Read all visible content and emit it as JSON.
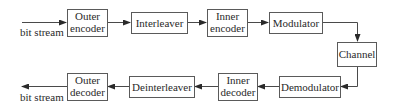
{
  "diagram": {
    "type": "block-diagram",
    "title": "",
    "input_label": "bit stream",
    "output_label": "bit stream",
    "transmit_chain": [
      {
        "id": "outer_encoder",
        "line1": "Outer",
        "line2": "encoder"
      },
      {
        "id": "interleaver",
        "line1": "Interleaver",
        "line2": ""
      },
      {
        "id": "inner_encoder",
        "line1": "Inner",
        "line2": "encoder"
      },
      {
        "id": "modulator",
        "line1": "Modulator",
        "line2": ""
      }
    ],
    "channel": {
      "id": "channel",
      "line1": "Channel"
    },
    "receive_chain": [
      {
        "id": "demodulator",
        "line1": "Demodulator",
        "line2": ""
      },
      {
        "id": "inner_decoder",
        "line1": "Inner",
        "line2": "decoder"
      },
      {
        "id": "deinterleaver",
        "line1": "Deinterleaver",
        "line2": ""
      },
      {
        "id": "outer_decoder",
        "line1": "Outer",
        "line2": "decoder"
      }
    ],
    "edges": [
      [
        "input",
        "outer_encoder"
      ],
      [
        "outer_encoder",
        "interleaver"
      ],
      [
        "interleaver",
        "inner_encoder"
      ],
      [
        "inner_encoder",
        "modulator"
      ],
      [
        "modulator",
        "channel"
      ],
      [
        "channel",
        "demodulator"
      ],
      [
        "demodulator",
        "inner_decoder"
      ],
      [
        "inner_decoder",
        "deinterleaver"
      ],
      [
        "deinterleaver",
        "outer_decoder"
      ],
      [
        "outer_decoder",
        "output"
      ]
    ]
  }
}
